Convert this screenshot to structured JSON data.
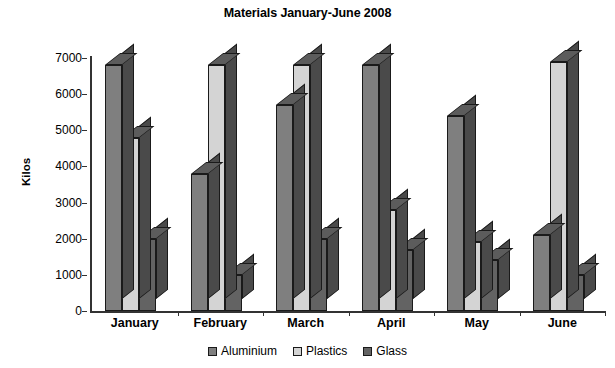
{
  "chart_data": {
    "type": "bar",
    "title": "Materials January-June 2008",
    "xlabel": "",
    "ylabel": "Kilos",
    "ylim": [
      0,
      7000
    ],
    "ytick_step": 1000,
    "yticks": [
      "7000",
      "6000",
      "5000",
      "4000",
      "3000",
      "2000",
      "1000",
      "0"
    ],
    "grid": false,
    "legend_position": "bottom",
    "style": "3d-clustered-column",
    "categories": [
      "January",
      "February",
      "March",
      "April",
      "May",
      "June"
    ],
    "series": [
      {
        "name": "Aluminium",
        "color": "#7f7f7f",
        "values": [
          6800,
          3800,
          5700,
          6800,
          5400,
          2100
        ]
      },
      {
        "name": "Plastics",
        "color": "#d4d4d4",
        "values": [
          4800,
          6800,
          6800,
          2800,
          1900,
          6900
        ]
      },
      {
        "name": "Glass",
        "color": "#636363",
        "values": [
          2000,
          1000,
          2000,
          1700,
          1400,
          1000
        ]
      }
    ]
  },
  "colors": {
    "axis": "#333333",
    "background": "#ffffff",
    "outline": "#1a1a1a",
    "side_shade": "#4a4a4a",
    "top_shade": "#5c5c5c"
  }
}
